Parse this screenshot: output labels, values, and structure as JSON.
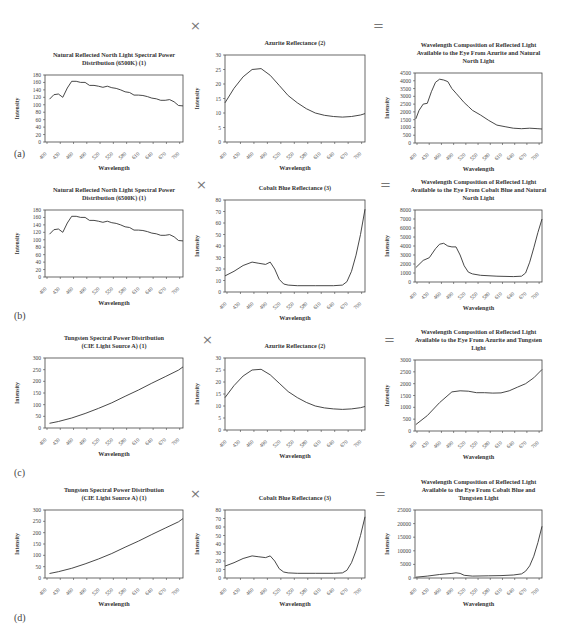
{
  "operators": {
    "times": "×",
    "equals": "="
  },
  "row_labels": [
    "(a)",
    "(b)",
    "(c)",
    "(d)"
  ],
  "chart_data": [
    {
      "id": "a1",
      "type": "line",
      "title": "Natural Reflected North Light Spectral Power Distribution (6500K) (1)",
      "title_lines": [
        "Natural Reflected North Light Spectral Power",
        "Distribution (6500K) (1)"
      ],
      "xlabel": "Wavelength",
      "ylabel": "Intensity",
      "x_ticks": [
        "400",
        "430",
        "460",
        "490",
        "520",
        "550",
        "580",
        "610",
        "640",
        "670",
        "700"
      ],
      "y_ticks": [
        0,
        20,
        40,
        60,
        80,
        100,
        120,
        140,
        160,
        180
      ],
      "ylim": [
        0,
        180
      ],
      "xlim": [
        400,
        710
      ],
      "x": [
        410,
        420,
        430,
        440,
        450,
        460,
        470,
        480,
        490,
        500,
        510,
        520,
        530,
        540,
        550,
        560,
        570,
        580,
        590,
        600,
        610,
        620,
        630,
        640,
        650,
        660,
        670,
        680,
        690,
        700,
        710
      ],
      "values": [
        115,
        127,
        129,
        120,
        145,
        163,
        163,
        160,
        160,
        152,
        152,
        150,
        147,
        150,
        146,
        144,
        140,
        135,
        133,
        126,
        126,
        125,
        122,
        118,
        116,
        112,
        112,
        114,
        108,
        98,
        97
      ]
    },
    {
      "id": "a2",
      "type": "line",
      "title": "Azurite Reflectance (2)",
      "title_lines": [
        "Azurite Reflectance (2)"
      ],
      "xlabel": "Wavelength",
      "ylabel": "Intensity",
      "x_ticks": [
        "400",
        "430",
        "460",
        "490",
        "520",
        "550",
        "580",
        "610",
        "640",
        "670",
        "700"
      ],
      "y_ticks": [
        0,
        5,
        10,
        15,
        20,
        25,
        30
      ],
      "ylim": [
        0,
        30
      ],
      "xlim": [
        400,
        710
      ],
      "x": [
        400,
        420,
        440,
        460,
        480,
        500,
        520,
        540,
        560,
        580,
        600,
        620,
        640,
        660,
        680,
        700,
        710
      ],
      "values": [
        13.5,
        18.5,
        22.5,
        25,
        25.3,
        23,
        19.5,
        16,
        13.5,
        11.5,
        10,
        9.2,
        8.8,
        8.6,
        8.8,
        9.3,
        9.8
      ]
    },
    {
      "id": "a3",
      "type": "line",
      "title": "Wavelength Composition of Reflected Light Available to the Eye From Azurite and Natural North Light",
      "title_lines": [
        "Wavelength Composition of Reflected Light",
        "Available to the Eye From Azurite and Natural",
        "North Light"
      ],
      "xlabel": "Wavelength",
      "ylabel": "Intensity",
      "x_ticks": [
        "400",
        "430",
        "460",
        "490",
        "520",
        "550",
        "580",
        "610",
        "640",
        "670",
        "700"
      ],
      "y_ticks": [
        0,
        500,
        1000,
        1500,
        2000,
        2500,
        3000,
        3500,
        4000,
        4500
      ],
      "ylim": [
        0,
        4500
      ],
      "xlim": [
        400,
        710
      ],
      "x": [
        402,
        410,
        420,
        430,
        440,
        450,
        460,
        470,
        480,
        490,
        500,
        510,
        520,
        530,
        540,
        560,
        580,
        600,
        620,
        640,
        660,
        680,
        700,
        710
      ],
      "values": [
        1550,
        2100,
        2500,
        2550,
        3300,
        3900,
        4100,
        4050,
        3950,
        3500,
        3200,
        2900,
        2600,
        2350,
        2100,
        1800,
        1450,
        1150,
        1050,
        950,
        920,
        950,
        920,
        900
      ]
    },
    {
      "id": "b1",
      "type": "line",
      "title": "Natural Reflected North Light Spectral Power Distribution (6500K) (1)",
      "title_lines": [
        "Natural Reflected North Light Spectral Power",
        "Distribution (6500K) (1)"
      ],
      "xlabel": "Wavelength",
      "ylabel": "Intensity",
      "x_ticks": [
        "400",
        "430",
        "460",
        "490",
        "520",
        "550",
        "580",
        "610",
        "640",
        "670",
        "700"
      ],
      "y_ticks": [
        0,
        20,
        40,
        60,
        80,
        100,
        120,
        140,
        160,
        180
      ],
      "ylim": [
        0,
        180
      ],
      "xlim": [
        400,
        710
      ],
      "x": [
        410,
        420,
        430,
        440,
        450,
        460,
        470,
        480,
        490,
        500,
        510,
        520,
        530,
        540,
        550,
        560,
        570,
        580,
        590,
        600,
        610,
        620,
        630,
        640,
        650,
        660,
        670,
        680,
        690,
        700,
        710
      ],
      "values": [
        115,
        127,
        129,
        120,
        145,
        163,
        163,
        160,
        160,
        152,
        152,
        150,
        147,
        150,
        146,
        144,
        140,
        135,
        133,
        126,
        126,
        125,
        122,
        118,
        116,
        112,
        112,
        114,
        108,
        98,
        97
      ]
    },
    {
      "id": "b2",
      "type": "line",
      "title": "Cobalt Blue Reflectance (3)",
      "title_lines": [
        "Cobalt Blue Reflectance (3)"
      ],
      "xlabel": "Wavelength",
      "ylabel": "Intensity",
      "x_ticks": [
        "400",
        "430",
        "460",
        "490",
        "520",
        "550",
        "580",
        "610",
        "640",
        "670",
        "700"
      ],
      "y_ticks": [
        0,
        10,
        20,
        30,
        40,
        50,
        60,
        70,
        80
      ],
      "ylim": [
        0,
        80
      ],
      "xlim": [
        400,
        710
      ],
      "x": [
        400,
        420,
        440,
        460,
        475,
        490,
        500,
        510,
        520,
        530,
        540,
        560,
        600,
        640,
        660,
        670,
        680,
        690,
        700,
        710
      ],
      "values": [
        14,
        18,
        23,
        26,
        25,
        24,
        26,
        20,
        11,
        7,
        6,
        5.5,
        5.5,
        5.5,
        6,
        9,
        18,
        32,
        50,
        72
      ]
    },
    {
      "id": "b3",
      "type": "line",
      "title": "Wavelength Composition of Reflected Light Available to the Eye From Cobalt Blue and Natural North Light",
      "title_lines": [
        "Wavelength Composition of Reflected Light",
        "Available to the Eye From Cobalt Blue and Natural",
        "North Light"
      ],
      "xlabel": "Wavelength",
      "ylabel": "Intensity",
      "x_ticks": [
        "400",
        "430",
        "460",
        "490",
        "520",
        "550",
        "580",
        "610",
        "640",
        "670",
        "700"
      ],
      "y_ticks": [
        0,
        1000,
        2000,
        3000,
        4000,
        5000,
        6000,
        7000,
        8000
      ],
      "ylim": [
        0,
        8000
      ],
      "xlim": [
        400,
        710
      ],
      "x": [
        402,
        420,
        435,
        450,
        460,
        470,
        480,
        490,
        500,
        510,
        520,
        530,
        540,
        560,
        600,
        640,
        660,
        670,
        680,
        690,
        700,
        710
      ],
      "values": [
        1600,
        2400,
        2700,
        3700,
        4200,
        4300,
        4000,
        3900,
        3900,
        3000,
        1800,
        1100,
        900,
        750,
        650,
        600,
        650,
        1000,
        2200,
        3800,
        5500,
        7000
      ]
    },
    {
      "id": "c1",
      "type": "line",
      "title": "Tungsten Spectral Power Distribution (CIE Light Source A) (1)",
      "title_lines": [
        "Tungsten Spectral Power Distribution",
        "(CIE Light Source A) (1)"
      ],
      "xlabel": "Wavelength",
      "ylabel": "Intensity",
      "x_ticks": [
        "400",
        "430",
        "460",
        "490",
        "520",
        "550",
        "580",
        "610",
        "640",
        "670",
        "700"
      ],
      "y_ticks": [
        0,
        50,
        100,
        150,
        200,
        250,
        300
      ],
      "ylim": [
        0,
        300
      ],
      "xlim": [
        400,
        710
      ],
      "x": [
        410,
        430,
        460,
        490,
        520,
        550,
        580,
        610,
        640,
        670,
        700,
        710
      ],
      "values": [
        20,
        28,
        43,
        62,
        84,
        108,
        136,
        163,
        192,
        220,
        248,
        262
      ]
    },
    {
      "id": "c2",
      "type": "line",
      "title": "Azurite Reflectance (2)",
      "title_lines": [
        "Azurite Reflectance (2)"
      ],
      "xlabel": "Wavelength",
      "ylabel": "Intensity",
      "x_ticks": [
        "400",
        "430",
        "460",
        "490",
        "520",
        "550",
        "580",
        "610",
        "640",
        "670",
        "700"
      ],
      "y_ticks": [
        0,
        5,
        10,
        15,
        20,
        25,
        30
      ],
      "ylim": [
        0,
        30
      ],
      "xlim": [
        400,
        710
      ],
      "x": [
        400,
        420,
        440,
        460,
        480,
        500,
        520,
        540,
        560,
        580,
        600,
        620,
        640,
        660,
        680,
        700,
        710
      ],
      "values": [
        13.5,
        18.5,
        22.5,
        25,
        25.3,
        23,
        19.5,
        16,
        13.5,
        11.5,
        10,
        9.2,
        8.8,
        8.6,
        8.8,
        9.3,
        9.8
      ]
    },
    {
      "id": "c3",
      "type": "line",
      "title": "Wavelength Composition of Reflected Light Available to the Eye From Azurite and Tungsten Light",
      "title_lines": [
        "Wavelength Composition of Reflected Light",
        "Available to the Eye From Azurite and Tungsten",
        "Light"
      ],
      "xlabel": "Wavelength",
      "ylabel": "Intensity",
      "x_ticks": [
        "400",
        "430",
        "460",
        "490",
        "520",
        "550",
        "580",
        "610",
        "640",
        "670",
        "700"
      ],
      "y_ticks": [
        0,
        500,
        1000,
        1500,
        2000,
        2500,
        3000
      ],
      "ylim": [
        0,
        3000
      ],
      "xlim": [
        400,
        710
      ],
      "x": [
        402,
        430,
        460,
        490,
        510,
        530,
        550,
        570,
        590,
        610,
        630,
        650,
        670,
        690,
        710
      ],
      "values": [
        270,
        650,
        1200,
        1650,
        1700,
        1680,
        1620,
        1620,
        1600,
        1610,
        1700,
        1850,
        2000,
        2250,
        2600
      ]
    },
    {
      "id": "d1",
      "type": "line",
      "title": "Tungsten Spectral Power Distribution (CIE Light Source A) (1)",
      "title_lines": [
        "Tungsten Spectral Power Distribution",
        "(CIE Light Source A) (1)"
      ],
      "xlabel": "Wavelength",
      "ylabel": "Intensity",
      "x_ticks": [
        "400",
        "430",
        "460",
        "490",
        "520",
        "550",
        "580",
        "610",
        "640",
        "670",
        "700"
      ],
      "y_ticks": [
        0,
        50,
        100,
        150,
        200,
        250,
        300
      ],
      "ylim": [
        0,
        300
      ],
      "xlim": [
        400,
        710
      ],
      "x": [
        410,
        430,
        460,
        490,
        520,
        550,
        580,
        610,
        640,
        670,
        700,
        710
      ],
      "values": [
        20,
        28,
        43,
        62,
        84,
        108,
        136,
        163,
        192,
        220,
        248,
        262
      ]
    },
    {
      "id": "d2",
      "type": "line",
      "title": "Cobalt Blue Reflectance (3)",
      "title_lines": [
        "Cobalt Blue Reflectance (3)"
      ],
      "xlabel": "Wavelength",
      "ylabel": "Intensity",
      "x_ticks": [
        "400",
        "430",
        "460",
        "490",
        "520",
        "550",
        "580",
        "610",
        "640",
        "670",
        "700"
      ],
      "y_ticks": [
        0,
        10,
        20,
        30,
        40,
        50,
        60,
        70,
        80
      ],
      "ylim": [
        0,
        80
      ],
      "xlim": [
        400,
        710
      ],
      "x": [
        400,
        420,
        440,
        460,
        475,
        490,
        500,
        510,
        520,
        530,
        540,
        560,
        600,
        640,
        660,
        670,
        680,
        690,
        700,
        710
      ],
      "values": [
        14,
        18,
        23,
        26,
        25,
        24,
        26,
        20,
        11,
        7,
        6,
        5.5,
        5.5,
        5.5,
        6,
        9,
        18,
        32,
        50,
        72
      ]
    },
    {
      "id": "d3",
      "type": "line",
      "title": "Wavelength Composition of Reflected Light Available to the Eye From Cobalt Blue and Tungsten Light",
      "title_lines": [
        "Wavelength Composition of Reflected Light",
        "Available to the Eye From Cobalt Blue and",
        "Tungsten Light"
      ],
      "xlabel": "Wavelength",
      "ylabel": "Intensity",
      "x_ticks": [
        "400",
        "430",
        "460",
        "490",
        "520",
        "550",
        "580",
        "610",
        "640",
        "670",
        "700"
      ],
      "y_ticks": [
        0,
        5000,
        10000,
        15000,
        20000,
        25000
      ],
      "ylim": [
        0,
        25000
      ],
      "xlim": [
        400,
        710
      ],
      "x": [
        402,
        430,
        460,
        490,
        500,
        510,
        520,
        540,
        580,
        610,
        640,
        660,
        670,
        680,
        690,
        700,
        710
      ],
      "values": [
        300,
        700,
        1300,
        1700,
        1900,
        1700,
        1000,
        700,
        800,
        900,
        1100,
        1500,
        2500,
        4500,
        8000,
        13000,
        19000
      ]
    }
  ],
  "layout": {
    "panels": [
      {
        "id": "a1",
        "x": 0,
        "y": 20,
        "w": 190,
        "h": 125,
        "plot": [
          45,
          55,
          138,
          67
        ],
        "title_top": 24
      },
      {
        "id": "a2",
        "x": 190,
        "y": 20,
        "w": 180,
        "h": 125,
        "plot": [
          35,
          35,
          140,
          87
        ],
        "title_top": 14
      },
      {
        "id": "a3",
        "x": 370,
        "y": 20,
        "w": 194,
        "h": 125,
        "plot": [
          45,
          53,
          127,
          70
        ],
        "title_top": 10
      },
      {
        "id": "b1",
        "x": 0,
        "y": 170,
        "w": 190,
        "h": 130,
        "plot": [
          45,
          40,
          138,
          67
        ],
        "title_top": 10
      },
      {
        "id": "b2",
        "x": 190,
        "y": 170,
        "w": 180,
        "h": 130,
        "plot": [
          35,
          30,
          140,
          92
        ],
        "title_top": 10
      },
      {
        "id": "b3",
        "x": 370,
        "y": 170,
        "w": 194,
        "h": 130,
        "plot": [
          45,
          40,
          127,
          72
        ],
        "title_top": 0
      },
      {
        "id": "c1",
        "x": 0,
        "y": 330,
        "w": 190,
        "h": 130,
        "plot": [
          45,
          28,
          138,
          70
        ],
        "title_top": 0
      },
      {
        "id": "c2",
        "x": 190,
        "y": 330,
        "w": 180,
        "h": 130,
        "plot": [
          35,
          28,
          140,
          72
        ],
        "title_top": 10
      },
      {
        "id": "c3",
        "x": 370,
        "y": 330,
        "w": 194,
        "h": 130,
        "plot": [
          45,
          30,
          127,
          71
        ],
        "title_top": -2
      },
      {
        "id": "d1",
        "x": 0,
        "y": 480,
        "w": 190,
        "h": 125,
        "plot": [
          45,
          30,
          138,
          68
        ],
        "title_top": 0
      },
      {
        "id": "d2",
        "x": 190,
        "y": 480,
        "w": 180,
        "h": 125,
        "plot": [
          35,
          30,
          140,
          68
        ],
        "title_top": 6
      },
      {
        "id": "d3",
        "x": 370,
        "y": 480,
        "w": 194,
        "h": 125,
        "plot": [
          45,
          30,
          127,
          68
        ],
        "title_top": -2
      }
    ],
    "operators": [
      {
        "sym": "times",
        "x": 190,
        "y": 18
      },
      {
        "sym": "equals",
        "x": 373,
        "y": 18
      },
      {
        "sym": "times",
        "x": 196,
        "y": 177
      },
      {
        "sym": "equals",
        "x": 380,
        "y": 177
      },
      {
        "sym": "times",
        "x": 202,
        "y": 332
      },
      {
        "sym": "equals",
        "x": 384,
        "y": 332
      },
      {
        "sym": "times",
        "x": 190,
        "y": 486
      },
      {
        "sym": "equals",
        "x": 375,
        "y": 486
      }
    ],
    "row_label_pos": [
      [
        14,
        148
      ],
      [
        14,
        310
      ],
      [
        14,
        467
      ],
      [
        14,
        612
      ]
    ]
  },
  "colors": {
    "line": "#333333",
    "frame": "#444444",
    "tick_text": "#444444"
  }
}
